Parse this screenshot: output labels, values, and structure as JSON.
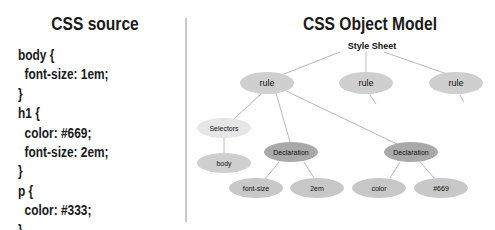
{
  "left_panel": {
    "title": "CSS source",
    "code_lines": [
      "body {",
      "  font-size: 1em;",
      "}",
      "h1 {",
      "  color: #669;",
      "  font-size: 2em;",
      "}",
      "p {",
      "  color: #333;",
      "}"
    ]
  },
  "right_panel": {
    "title": "CSS Object Model",
    "root_label": "Style Sheet",
    "nodes": {
      "rule1": "rule",
      "rule2": "rule",
      "rule3": "rule",
      "selectors": "Selectors",
      "selector_body": "body",
      "declaration1": "Declaration",
      "decl1_property": "font-size",
      "decl1_value": "2em",
      "declaration2": "Declaration",
      "decl2_property": "color",
      "decl2_value": "#669"
    }
  },
  "colors": {
    "rule_fill": "#cfcfcf",
    "selectors_fill": "#e6e6e6",
    "declaration_fill": "#a9a9a9",
    "leaf_fill": "#c8c8c8",
    "edge": "#b8b8b8",
    "divider": "#c8c8c8"
  }
}
